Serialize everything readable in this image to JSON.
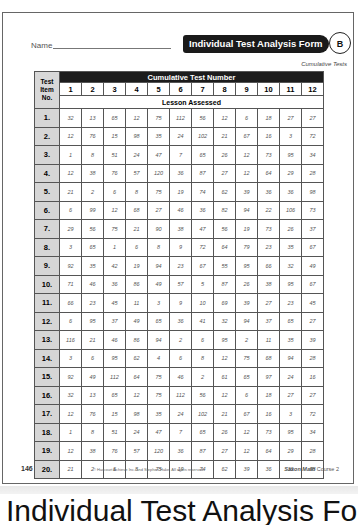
{
  "form": {
    "name_label": "Name",
    "title": "Individual Test Analysis Form",
    "badge": "B",
    "subtitle": "Cumulative Tests"
  },
  "table": {
    "corner_label": "Test Item No.",
    "band_label": "Cumulative Test Number",
    "lesson_label": "Lesson Assessed",
    "columns": [
      "1",
      "2",
      "3",
      "4",
      "5",
      "6",
      "7",
      "8",
      "9",
      "10",
      "11",
      "12"
    ],
    "rows": [
      {
        "label": "1.",
        "values": [
          "32",
          "13",
          "65",
          "12",
          "75",
          "112",
          "56",
          "12",
          "6",
          "18",
          "27",
          "27"
        ]
      },
      {
        "label": "2.",
        "values": [
          "12",
          "76",
          "15",
          "98",
          "35",
          "24",
          "102",
          "21",
          "67",
          "16",
          "3",
          "72"
        ]
      },
      {
        "label": "3.",
        "values": [
          "1",
          "8",
          "51",
          "24",
          "47",
          "7",
          "65",
          "26",
          "12",
          "73",
          "95",
          "34"
        ]
      },
      {
        "label": "4.",
        "values": [
          "12",
          "38",
          "76",
          "57",
          "120",
          "36",
          "87",
          "27",
          "12",
          "64",
          "29",
          "28"
        ]
      },
      {
        "label": "5.",
        "values": [
          "21",
          "2",
          "6",
          "8",
          "75",
          "19",
          "74",
          "62",
          "39",
          "36",
          "36",
          "98"
        ]
      },
      {
        "label": "6.",
        "values": [
          "6",
          "99",
          "12",
          "68",
          "27",
          "46",
          "36",
          "82",
          "94",
          "22",
          "106",
          "73"
        ]
      },
      {
        "label": "7.",
        "values": [
          "29",
          "56",
          "75",
          "21",
          "90",
          "38",
          "47",
          "56",
          "19",
          "73",
          "26",
          "37"
        ]
      },
      {
        "label": "8.",
        "values": [
          "3",
          "65",
          "1",
          "6",
          "8",
          "9",
          "72",
          "64",
          "79",
          "23",
          "35",
          "67"
        ]
      },
      {
        "label": "9.",
        "values": [
          "92",
          "35",
          "42",
          "19",
          "94",
          "23",
          "67",
          "55",
          "95",
          "66",
          "32",
          "49"
        ]
      },
      {
        "label": "10.",
        "values": [
          "71",
          "46",
          "36",
          "86",
          "49",
          "57",
          "5",
          "87",
          "26",
          "38",
          "95",
          "67"
        ]
      },
      {
        "label": "11.",
        "values": [
          "66",
          "23",
          "45",
          "11",
          "3",
          "9",
          "10",
          "69",
          "39",
          "27",
          "23",
          "45"
        ]
      },
      {
        "label": "12.",
        "values": [
          "6",
          "95",
          "37",
          "49",
          "65",
          "36",
          "41",
          "32",
          "94",
          "37",
          "65",
          "27"
        ]
      },
      {
        "label": "13.",
        "values": [
          "116",
          "21",
          "46",
          "86",
          "94",
          "2",
          "6",
          "95",
          "2",
          "11",
          "35",
          "39"
        ]
      },
      {
        "label": "14.",
        "values": [
          "3",
          "6",
          "95",
          "62",
          "4",
          "6",
          "8",
          "12",
          "75",
          "68",
          "94",
          "28"
        ]
      },
      {
        "label": "15.",
        "values": [
          "92",
          "49",
          "112",
          "64",
          "75",
          "46",
          "2",
          "61",
          "65",
          "97",
          "24",
          "16"
        ]
      },
      {
        "label": "16.",
        "values": [
          "32",
          "13",
          "65",
          "12",
          "75",
          "112",
          "56",
          "12",
          "6",
          "18",
          "27",
          "27"
        ]
      },
      {
        "label": "17.",
        "values": [
          "12",
          "76",
          "15",
          "98",
          "35",
          "24",
          "102",
          "21",
          "67",
          "16",
          "3",
          "72"
        ]
      },
      {
        "label": "18.",
        "values": [
          "1",
          "8",
          "51",
          "24",
          "47",
          "7",
          "65",
          "26",
          "12",
          "73",
          "95",
          "34"
        ]
      },
      {
        "label": "19.",
        "values": [
          "12",
          "38",
          "76",
          "57",
          "120",
          "36",
          "87",
          "27",
          "12",
          "64",
          "29",
          "28"
        ]
      },
      {
        "label": "20.",
        "values": [
          "21",
          "2",
          "6",
          "8",
          "75",
          "19",
          "74",
          "62",
          "39",
          "36",
          "36",
          "98"
        ]
      }
    ]
  },
  "footer": {
    "page_number": "146",
    "copyright": "© Harcourt Achieve Inc. and Stephen Hake. All rights reserved.",
    "book_series": "Saxon Math",
    "book_course": "Course 2"
  },
  "caption": {
    "text": "Individual Test Analysis Form"
  }
}
